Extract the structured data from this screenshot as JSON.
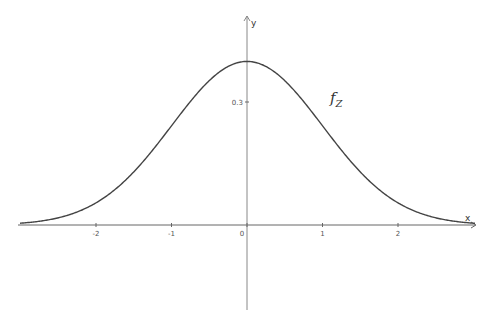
{
  "chart_data": {
    "type": "line",
    "title": "",
    "xlabel": "x",
    "ylabel": "y",
    "xlim": [
      -3.3,
      3.0
    ],
    "ylim": [
      -0.21,
      0.55
    ],
    "grid": false,
    "x_ticks": [
      -2,
      -1,
      0,
      1,
      2
    ],
    "x_tick_labels": [
      "-2",
      "-1",
      "0",
      "1",
      "2"
    ],
    "y_ticks": [
      0.3
    ],
    "y_tick_labels": [
      "0.3"
    ],
    "series": [
      {
        "name": "f_Z",
        "function": "standard normal density (1/sqrt(2π))·exp(-x²/2)",
        "x": [
          -3,
          -2.5,
          -2,
          -1.5,
          -1,
          -0.5,
          0,
          0.5,
          1,
          1.5,
          2,
          2.5,
          3
        ],
        "values": [
          0.0044,
          0.0175,
          0.054,
          0.1295,
          0.242,
          0.3521,
          0.3989,
          0.3521,
          0.242,
          0.1295,
          0.054,
          0.0175,
          0.0044
        ],
        "color": "#444444"
      }
    ],
    "annotations": [
      {
        "text_main": "f",
        "text_sub": "Z",
        "x": 1.1,
        "y": 0.33
      }
    ]
  },
  "labels": {
    "x_axis": "x",
    "y_axis": "y",
    "func_main": "f",
    "func_sub": "Z"
  },
  "layout": {
    "origin_px": [
      247,
      225
    ],
    "x_unit_px": 75.5,
    "y_unit_px": 410
  }
}
